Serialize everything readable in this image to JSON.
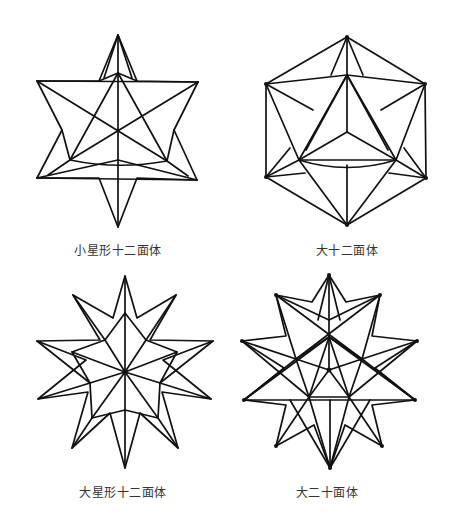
{
  "figures": [
    {
      "id": "small-stellated-dodecahedron",
      "label": "小星形十二面体",
      "center": [
        118,
        130
      ]
    },
    {
      "id": "great-dodecahedron",
      "label": "大十二面体",
      "center": [
        347,
        132
      ]
    },
    {
      "id": "great-stellated-dodecahedron",
      "label": "大星形十二面体",
      "center": [
        125,
        372
      ]
    },
    {
      "id": "great-icosahedron",
      "label": "大二十面体",
      "center": [
        329,
        370
      ]
    }
  ],
  "colors": {
    "stroke": "#111111",
    "text": "#333333",
    "background": "#ffffff"
  }
}
